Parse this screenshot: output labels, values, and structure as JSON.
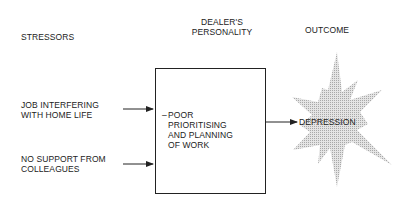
{
  "columns": {
    "stressors": "STRESSORS",
    "personality_line1": "DEALER'S",
    "personality_line2": "PERSONALITY",
    "outcome": "OUTCOME"
  },
  "stressors": [
    {
      "line1": "JOB INTERFERING",
      "line2": "WITH HOME LIFE"
    },
    {
      "line1": "NO SUPPORT FROM",
      "line2": "COLLEAGUES"
    }
  ],
  "personality_box": {
    "bullet": "–",
    "lines": [
      "POOR",
      "PRIORITISING",
      "AND PLANNING",
      "OF WORK"
    ]
  },
  "outcome": {
    "label": "DEPRESSION",
    "shape": "starburst",
    "fill": "#d0d0d0"
  }
}
